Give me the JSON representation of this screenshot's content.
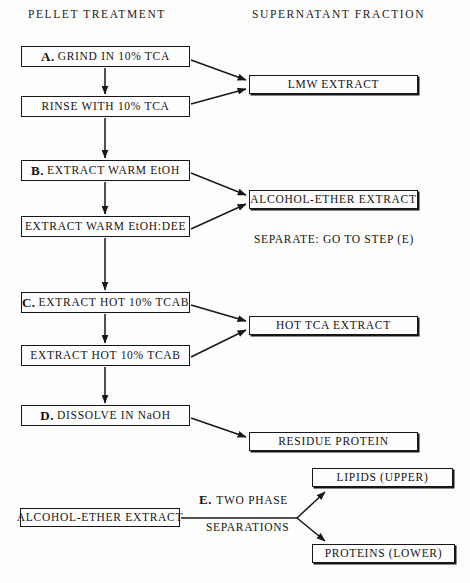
{
  "headers": [
    {
      "text": "PELLET    TREATMENT",
      "x": 28,
      "y": 8
    },
    {
      "text": "SUPERNATANT   FRACTION",
      "x": 252,
      "y": 8
    }
  ],
  "pellet_nodes": [
    {
      "id": "grind-tca",
      "lead": "A.",
      "label": "GRIND IN 10% TCA",
      "x": 21,
      "y": 46,
      "w": 169,
      "h": 21
    },
    {
      "id": "rinse-tca",
      "lead": "",
      "label": "RINSE WITH 10% TCA",
      "x": 21,
      "y": 96,
      "w": 169,
      "h": 21
    },
    {
      "id": "extract-warm-etoh",
      "lead": "B.",
      "label": "EXTRACT WARM EtOH",
      "x": 21,
      "y": 160,
      "w": 169,
      "h": 21
    },
    {
      "id": "extract-warm-etoh-dee",
      "lead": "",
      "label": "EXTRACT WARM EtOH:DEE",
      "x": 21,
      "y": 216,
      "w": 169,
      "h": 21
    },
    {
      "id": "extract-hot-tcab-c",
      "lead": "C.",
      "label": "EXTRACT HOT 10% TCAB",
      "x": 21,
      "y": 292,
      "w": 169,
      "h": 21
    },
    {
      "id": "extract-hot-tcab-2",
      "lead": "",
      "label": "EXTRACT HOT 10% TCAB",
      "x": 21,
      "y": 345,
      "w": 169,
      "h": 21
    },
    {
      "id": "dissolve-naoh",
      "lead": "D.",
      "label": "DISSOLVE IN NaOH",
      "x": 21,
      "y": 405,
      "w": 169,
      "h": 21
    }
  ],
  "supernatant_nodes": [
    {
      "id": "lmw-extract",
      "label": "LMW EXTRACT",
      "x": 249,
      "y": 75,
      "w": 169,
      "h": 19,
      "heavy": true
    },
    {
      "id": "alcohol-ether-extract",
      "label": "ALCOHOL-ETHER EXTRACT",
      "x": 249,
      "y": 190,
      "w": 169,
      "h": 19,
      "heavy": true
    },
    {
      "id": "hot-tca-extract",
      "label": "HOT TCA EXTRACT",
      "x": 249,
      "y": 316,
      "w": 169,
      "h": 19,
      "heavy": true
    },
    {
      "id": "residue-protein",
      "label": "RESIDUE PROTEIN",
      "x": 249,
      "y": 432,
      "w": 169,
      "h": 19,
      "heavy": true
    }
  ],
  "two_phase_nodes": [
    {
      "id": "alcohol-ether-extract-input",
      "label": "ALCOHOL-ETHER EXTRACT",
      "x": 20,
      "y": 508,
      "w": 160,
      "h": 19
    },
    {
      "id": "lipids-upper",
      "label": "LIPIDS  (UPPER)",
      "x": 312,
      "y": 468,
      "w": 141,
      "h": 19,
      "heavy": true
    },
    {
      "id": "proteins-lower",
      "label": "PROTEINS  (LOWER)",
      "x": 312,
      "y": 544,
      "w": 143,
      "h": 19,
      "heavy": true
    }
  ],
  "free_labels": [
    {
      "id": "separate-note",
      "lead": "",
      "text": "SEPARATE:  GO TO STEP (E)",
      "x": 254,
      "y": 233
    },
    {
      "id": "two-phase-line1",
      "lead": "E.",
      "text": "TWO PHASE",
      "x": 199,
      "y": 492
    },
    {
      "id": "two-phase-line2",
      "lead": "",
      "text": "SEPARATIONS",
      "x": 206,
      "y": 521
    }
  ],
  "connectors": {
    "vertical_arrows": [
      {
        "id": "grind-to-rinse",
        "x": 105,
        "y1": 68,
        "y2": 94
      },
      {
        "id": "rinse-to-extract-b",
        "x": 105,
        "y1": 118,
        "y2": 158
      },
      {
        "id": "extract-b-to-dee",
        "x": 105,
        "y1": 182,
        "y2": 214
      },
      {
        "id": "dee-to-extract-c",
        "x": 105,
        "y1": 238,
        "y2": 290
      },
      {
        "id": "extract-c-to-second",
        "x": 105,
        "y1": 314,
        "y2": 343
      },
      {
        "id": "second-to-dissolve",
        "x": 105,
        "y1": 367,
        "y2": 403
      }
    ],
    "diagonal_arrows": [
      {
        "id": "grind-to-lmw",
        "x1": 191,
        "y1": 60,
        "x2": 246,
        "y2": 80
      },
      {
        "id": "rinse-to-lmw",
        "x1": 191,
        "y1": 104,
        "x2": 246,
        "y2": 89
      },
      {
        "id": "extract-b-to-alcohol",
        "x1": 191,
        "y1": 173,
        "x2": 246,
        "y2": 195
      },
      {
        "id": "dee-to-alcohol",
        "x1": 191,
        "y1": 229,
        "x2": 246,
        "y2": 204
      },
      {
        "id": "extract-c-to-hot-tca",
        "x1": 191,
        "y1": 305,
        "x2": 246,
        "y2": 321
      },
      {
        "id": "second-to-hot-tca",
        "x1": 191,
        "y1": 357,
        "x2": 246,
        "y2": 330
      },
      {
        "id": "dissolve-to-residue",
        "x1": 191,
        "y1": 418,
        "x2": 246,
        "y2": 437
      },
      {
        "id": "fork-to-lipids",
        "x1": 297,
        "y1": 518,
        "x2": 325,
        "y2": 492
      },
      {
        "id": "fork-to-proteins",
        "x1": 297,
        "y1": 518,
        "x2": 325,
        "y2": 541
      }
    ],
    "plain_lines": [
      {
        "id": "extract-to-fork",
        "x1": 181,
        "y1": 518,
        "x2": 297,
        "y2": 518
      }
    ]
  }
}
